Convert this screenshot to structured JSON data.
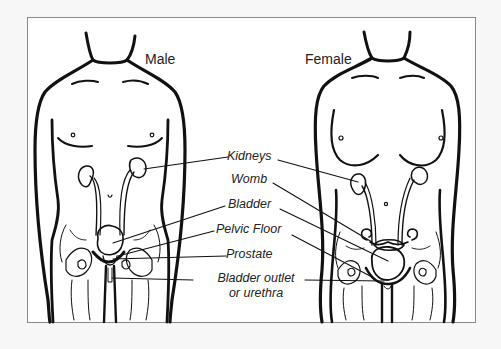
{
  "diagram": {
    "titles": {
      "male": "Male",
      "female": "Female"
    },
    "labels": [
      {
        "id": "kidneys",
        "text": "Kidneys"
      },
      {
        "id": "womb",
        "text": "Womb"
      },
      {
        "id": "bladder",
        "text": "Bladder"
      },
      {
        "id": "pelvic_floor",
        "text": "Pelvic Floor"
      },
      {
        "id": "prostate",
        "text": "Prostate"
      },
      {
        "id": "bladder_outlet",
        "text": "Bladder outlet",
        "text2": "or urethra"
      }
    ],
    "colors": {
      "background": "#f7f7f7",
      "panel": "#ffffff",
      "border": "#8a8a8a",
      "ink": "#111111"
    }
  }
}
